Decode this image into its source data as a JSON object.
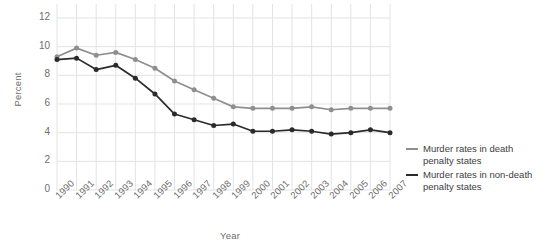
{
  "chart_data": {
    "type": "line",
    "title": "",
    "xlabel": "Year",
    "ylabel": "Percent",
    "ylim": [
      0,
      12
    ],
    "ytick_values": [
      12,
      10,
      8,
      6,
      4,
      2,
      0
    ],
    "ytick_labels": [
      "12",
      "10",
      "8",
      "6",
      "4",
      "2",
      "0"
    ],
    "grid": true,
    "legend_position": "right",
    "categories": [
      "1990",
      "1991",
      "1992",
      "1993",
      "1994",
      "1995",
      "1996",
      "1997",
      "1998",
      "1999",
      "2000",
      "2001",
      "2002",
      "2003",
      "2004",
      "2005",
      "2006",
      "2007"
    ],
    "x": [
      1990,
      1991,
      1992,
      1993,
      1994,
      1995,
      1996,
      1997,
      1998,
      1999,
      2000,
      2001,
      2002,
      2003,
      2004,
      2005,
      2006,
      2007
    ],
    "series": [
      {
        "name": "Murder rates in death penalty states",
        "color": "#8f8f8f",
        "marker": "circle",
        "values": [
          9.3,
          9.9,
          9.4,
          9.6,
          9.1,
          8.5,
          7.6,
          7.0,
          6.4,
          5.8,
          5.7,
          5.7,
          5.7,
          5.8,
          5.6,
          5.7,
          5.7,
          5.7
        ]
      },
      {
        "name": "Murder rates in non-death penalty states",
        "color": "#2b2b2b",
        "marker": "circle",
        "values": [
          9.1,
          9.2,
          8.4,
          8.7,
          7.8,
          6.7,
          5.3,
          4.9,
          4.5,
          4.6,
          4.1,
          4.1,
          4.2,
          4.1,
          3.9,
          4.0,
          4.2,
          4.0
        ]
      }
    ]
  },
  "legend": {
    "items": [
      {
        "label": "Murder rates in death penalty states",
        "color": "#8f8f8f"
      },
      {
        "label": "Murder rates in non-death penalty states",
        "color": "#2b2b2b"
      }
    ]
  },
  "colors": {
    "grid": "#e3e3e3",
    "axis_text": "#6e6e6e",
    "legend_text": "#3d3d3d",
    "background": "#ffffff",
    "series_light": "#8f8f8f",
    "series_dark": "#2b2b2b"
  }
}
